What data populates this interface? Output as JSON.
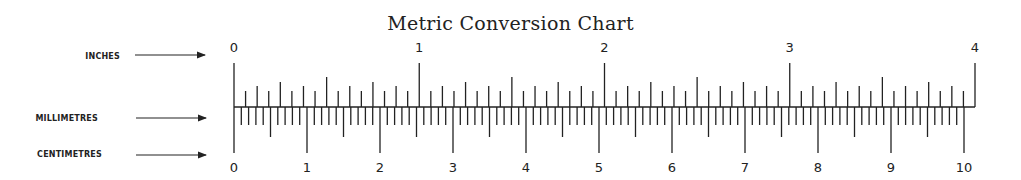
{
  "title": "Metric Conversion Chart",
  "row_labels": {
    "inches": "INCHES",
    "millimetres": "MILLIMETRES",
    "centimetres": "CENTIMETRES"
  },
  "inch_labels": [
    "0",
    "1",
    "2",
    "3",
    "4"
  ],
  "cm_labels": [
    "0",
    "1",
    "2",
    "3",
    "4",
    "5",
    "6",
    "7",
    "8",
    "9",
    "10"
  ],
  "scale": {
    "inch_min": 0,
    "inch_max": 4,
    "inch_subdivisions_per_inch": 16,
    "cm_min": 0,
    "cm_max": 10,
    "mm_per_cm": 10
  },
  "colors": {
    "ink": "#222222",
    "background": "#ffffff"
  }
}
